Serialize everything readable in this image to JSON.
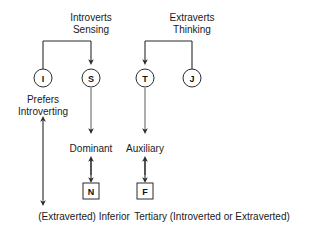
{
  "diagram": {
    "background_color": "#ffffff",
    "line_color": "#2b2b2b",
    "text_color": "#1a1a1a",
    "headers": {
      "left_line1": "Introverts",
      "left_line2": "Sensing",
      "right_line1": "Extraverts",
      "right_line2": "Thinking"
    },
    "circle_nodes": [
      {
        "letter": "I",
        "x": 43,
        "y": 78
      },
      {
        "letter": "S",
        "x": 91,
        "y": 78
      },
      {
        "letter": "T",
        "x": 145,
        "y": 78
      },
      {
        "letter": "J",
        "x": 192,
        "y": 78
      }
    ],
    "box_nodes": [
      {
        "letter": "N",
        "x": 91,
        "y": 191
      },
      {
        "letter": "F",
        "x": 145,
        "y": 191
      }
    ],
    "labels": {
      "prefers_line1": "Prefers",
      "prefers_line2": "Introverting",
      "dominant": "Dominant",
      "auxiliary": "Auxiliary",
      "inferior": "(Extraverted) Inferior",
      "tertiary": "Tertiary (Introverted or Extraverted)"
    }
  }
}
